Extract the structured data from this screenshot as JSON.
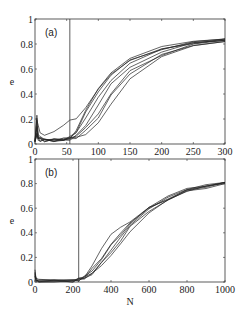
{
  "chart_data": [
    {
      "type": "line",
      "panel_label": "(a)",
      "xlabel": "",
      "ylabel": "e",
      "xlim": [
        0,
        300
      ],
      "ylim": [
        0,
        1
      ],
      "xticks": [
        0,
        50,
        100,
        150,
        200,
        250,
        300
      ],
      "yticks": [
        0,
        0.2,
        0.4,
        0.6,
        0.8,
        1
      ],
      "ytick_labels": [
        "0",
        "0.2",
        "0.4",
        "0.6",
        "0.8",
        "1"
      ],
      "vertical_line_x": 55,
      "grid": false,
      "legend": null,
      "series": [
        {
          "name": "run 1",
          "x": [
            0,
            3,
            5,
            8,
            15,
            30,
            45,
            55,
            65,
            80,
            100,
            120,
            150,
            200,
            250,
            300
          ],
          "values": [
            0.02,
            0.2,
            0.05,
            0.04,
            0.03,
            0.03,
            0.04,
            0.05,
            0.1,
            0.25,
            0.42,
            0.55,
            0.67,
            0.76,
            0.81,
            0.84
          ]
        },
        {
          "name": "run 2",
          "x": [
            0,
            3,
            5,
            8,
            15,
            30,
            45,
            55,
            65,
            80,
            100,
            120,
            150,
            200,
            250,
            300
          ],
          "values": [
            0.02,
            0.15,
            0.05,
            0.04,
            0.03,
            0.03,
            0.04,
            0.05,
            0.08,
            0.2,
            0.38,
            0.52,
            0.65,
            0.75,
            0.8,
            0.83
          ]
        },
        {
          "name": "run 3",
          "x": [
            0,
            3,
            5,
            8,
            15,
            30,
            45,
            55,
            65,
            80,
            100,
            120,
            150,
            200,
            250,
            300
          ],
          "values": [
            0.02,
            0.22,
            0.06,
            0.05,
            0.03,
            0.03,
            0.04,
            0.05,
            0.12,
            0.28,
            0.45,
            0.57,
            0.68,
            0.77,
            0.81,
            0.84
          ]
        },
        {
          "name": "run 4",
          "x": [
            0,
            3,
            5,
            8,
            15,
            30,
            45,
            55,
            65,
            80,
            100,
            120,
            150,
            200,
            250,
            300
          ],
          "values": [
            0.02,
            0.1,
            0.04,
            0.04,
            0.03,
            0.03,
            0.03,
            0.04,
            0.06,
            0.15,
            0.32,
            0.47,
            0.62,
            0.74,
            0.8,
            0.83
          ]
        },
        {
          "name": "run 5",
          "x": [
            0,
            3,
            5,
            8,
            15,
            30,
            45,
            55,
            65,
            80,
            100,
            120,
            150,
            200,
            250,
            300
          ],
          "values": [
            0.02,
            0.12,
            0.05,
            0.04,
            0.03,
            0.03,
            0.04,
            0.05,
            0.07,
            0.12,
            0.25,
            0.4,
            0.58,
            0.72,
            0.79,
            0.83
          ]
        },
        {
          "name": "run 6",
          "x": [
            0,
            3,
            5,
            8,
            15,
            30,
            45,
            55,
            65,
            80,
            100,
            120,
            150,
            200,
            250,
            300
          ],
          "values": [
            0.02,
            0.08,
            0.04,
            0.03,
            0.03,
            0.03,
            0.03,
            0.04,
            0.05,
            0.08,
            0.18,
            0.33,
            0.53,
            0.7,
            0.78,
            0.82
          ]
        },
        {
          "name": "run 7",
          "x": [
            0,
            3,
            5,
            8,
            15,
            30,
            45,
            55,
            65,
            80,
            100,
            120,
            150,
            200,
            250,
            300
          ],
          "values": [
            0.02,
            0.18,
            0.15,
            0.1,
            0.08,
            0.1,
            0.14,
            0.18,
            0.2,
            0.3,
            0.45,
            0.56,
            0.66,
            0.75,
            0.8,
            0.84
          ]
        },
        {
          "name": "run 8",
          "x": [
            0,
            3,
            5,
            8,
            15,
            30,
            45,
            55,
            65,
            80,
            100,
            120,
            150,
            200,
            250,
            300
          ],
          "values": [
            0.02,
            0.09,
            0.04,
            0.03,
            0.03,
            0.03,
            0.03,
            0.04,
            0.05,
            0.1,
            0.22,
            0.38,
            0.57,
            0.71,
            0.79,
            0.82
          ]
        }
      ]
    },
    {
      "type": "line",
      "panel_label": "(b)",
      "xlabel": "N",
      "ylabel": "e",
      "xlim": [
        0,
        1000
      ],
      "ylim": [
        0,
        1
      ],
      "xticks": [
        0,
        200,
        400,
        600,
        800,
        1000
      ],
      "yticks": [
        0,
        0.2,
        0.4,
        0.6,
        0.8,
        1
      ],
      "ytick_labels": [
        "0",
        "0.2",
        "0.4",
        "0.6",
        "0.8",
        "1"
      ],
      "vertical_line_x": 230,
      "grid": false,
      "legend": null,
      "series": [
        {
          "name": "run 1",
          "x": [
            0,
            5,
            20,
            100,
            200,
            230,
            260,
            300,
            350,
            400,
            450,
            500,
            600,
            700,
            800,
            900,
            1000
          ],
          "values": [
            0.1,
            0.02,
            0.01,
            0.005,
            0.01,
            0.02,
            0.04,
            0.1,
            0.2,
            0.3,
            0.4,
            0.48,
            0.6,
            0.68,
            0.74,
            0.78,
            0.81
          ]
        },
        {
          "name": "run 2",
          "x": [
            0,
            5,
            20,
            100,
            200,
            230,
            260,
            300,
            350,
            400,
            450,
            500,
            600,
            700,
            800,
            900,
            1000
          ],
          "values": [
            0.08,
            0.02,
            0.01,
            0.005,
            0.01,
            0.02,
            0.05,
            0.13,
            0.26,
            0.38,
            0.45,
            0.5,
            0.61,
            0.69,
            0.75,
            0.78,
            0.81
          ]
        },
        {
          "name": "run 3",
          "x": [
            0,
            5,
            20,
            100,
            200,
            230,
            260,
            300,
            350,
            400,
            450,
            500,
            600,
            700,
            800,
            900,
            1000
          ],
          "values": [
            0.06,
            0.02,
            0.01,
            0.005,
            0.01,
            0.02,
            0.03,
            0.08,
            0.17,
            0.27,
            0.37,
            0.46,
            0.59,
            0.68,
            0.74,
            0.78,
            0.81
          ]
        },
        {
          "name": "run 4",
          "x": [
            0,
            5,
            20,
            100,
            200,
            230,
            260,
            300,
            350,
            400,
            450,
            500,
            600,
            700,
            800,
            900,
            1000
          ],
          "values": [
            0.05,
            0.02,
            0.01,
            0.005,
            0.01,
            0.02,
            0.03,
            0.07,
            0.15,
            0.24,
            0.34,
            0.44,
            0.58,
            0.67,
            0.73,
            0.77,
            0.8
          ]
        },
        {
          "name": "run 5",
          "x": [
            0,
            5,
            20,
            100,
            200,
            230,
            260,
            300,
            350,
            400,
            450,
            500,
            600,
            700,
            800,
            900,
            1000
          ],
          "values": [
            0.07,
            0.02,
            0.01,
            0.005,
            0.01,
            0.02,
            0.04,
            0.09,
            0.19,
            0.29,
            0.39,
            0.47,
            0.6,
            0.68,
            0.74,
            0.78,
            0.81
          ]
        },
        {
          "name": "run 6",
          "x": [
            0,
            5,
            20,
            100,
            200,
            230,
            260,
            300,
            350,
            400,
            450,
            500,
            600,
            700,
            800,
            900,
            1000
          ],
          "values": [
            0.05,
            0.02,
            0.01,
            0.005,
            0.01,
            0.02,
            0.03,
            0.06,
            0.13,
            0.22,
            0.32,
            0.42,
            0.57,
            0.67,
            0.73,
            0.77,
            0.8
          ]
        }
      ]
    }
  ]
}
